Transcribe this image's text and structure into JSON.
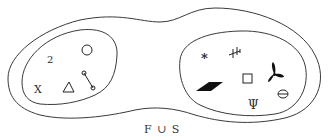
{
  "diagram": {
    "label": "F ∪ S",
    "colors": {
      "stroke": "#3a3a3a",
      "symbol": "#222222",
      "background": "#ffffff"
    },
    "sets": [
      {
        "name": "F",
        "elements": [
          {
            "kind": "text",
            "value": "2",
            "semantic": "numeral-two"
          },
          {
            "kind": "shape",
            "value": "circle",
            "semantic": "circle-icon"
          },
          {
            "kind": "text",
            "value": "X",
            "semantic": "letter-x"
          },
          {
            "kind": "shape",
            "value": "triangle",
            "semantic": "triangle-icon"
          },
          {
            "kind": "shape",
            "value": "segment-with-endpoints",
            "semantic": "line-segment-icon"
          }
        ]
      },
      {
        "name": "S",
        "elements": [
          {
            "kind": "text",
            "value": "*",
            "semantic": "asterisk"
          },
          {
            "kind": "shape",
            "value": "cross-glyph",
            "semantic": "cross-glyph-icon"
          },
          {
            "kind": "shape",
            "value": "filled-parallelogram",
            "semantic": "parallelogram-icon"
          },
          {
            "kind": "shape",
            "value": "square",
            "semantic": "square-icon"
          },
          {
            "kind": "shape",
            "value": "three-blade-propeller",
            "semantic": "propeller-icon"
          },
          {
            "kind": "text",
            "value": "Ψ",
            "semantic": "psi-glyph"
          },
          {
            "kind": "text",
            "value": "θ",
            "semantic": "theta-glyph"
          }
        ]
      }
    ]
  }
}
